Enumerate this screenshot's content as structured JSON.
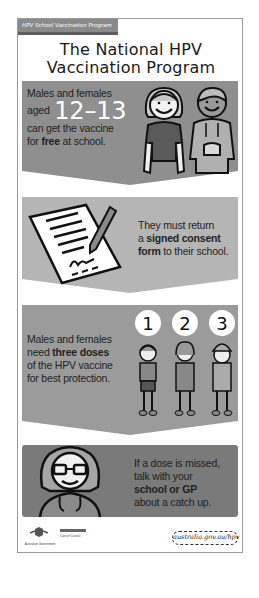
{
  "poster": {
    "tag": "HPV School Vaccination Program",
    "title_line1": "The National HPV",
    "title_line2": "Vaccination Program"
  },
  "panels": [
    {
      "line1": "Males and females",
      "line2_prefix": "aged",
      "age_range": "12–13",
      "line3": "can get the vaccine",
      "line4_prefix": "for ",
      "line4_bold": "free",
      "line4_suffix": " at school.",
      "illustration": "girl-and-boy-icon",
      "color": "#8f8f8f"
    },
    {
      "line1": "They must return",
      "line2_prefix": "a ",
      "line2_bold": "signed consent",
      "line3_bold": "form",
      "line3_suffix": " to their school.",
      "illustration": "signed-form-with-pen-icon",
      "color": "#b5b5b5"
    },
    {
      "line1": "Males and females",
      "line2_prefix": "need ",
      "line2_bold": "three doses",
      "line3": "of the HPV vaccine",
      "line4": "for best protection.",
      "doses": [
        "1",
        "2",
        "3"
      ],
      "illustration": "three-children-icon",
      "color": "#9b9b9b"
    },
    {
      "line1": "If a dose is missed,",
      "line2": "talk with your",
      "line3_bold": "school or GP",
      "line4": "about a catch up.",
      "illustration": "doctor-with-stethoscope-icon",
      "color": "#7a7a7a"
    }
  ],
  "footer": {
    "gov_label": "Australian Government",
    "partner_label": "Cancer Council",
    "url": "australia.gov.au/hpv"
  }
}
